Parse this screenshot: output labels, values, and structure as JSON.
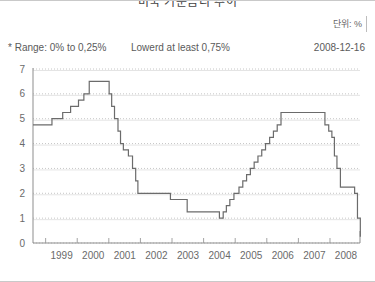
{
  "header": {
    "title": "미국 기준금리 추이",
    "unit_label": "단위: %"
  },
  "notes": {
    "range": "* Range: 0% to 0,25%",
    "lowered": "Lowerd at least 0,75%",
    "date": "2008-12-16"
  },
  "chart_data": {
    "type": "line",
    "title": "미국 기준금리 추이",
    "xlabel": "",
    "ylabel": "",
    "unit": "%",
    "grid": true,
    "legend_position": "none",
    "line_color": "#6b6b6b",
    "step": "post",
    "xlim": [
      1998.6,
      2008.95
    ],
    "ylim": [
      0,
      7
    ],
    "yticks": [
      0,
      1,
      2,
      3,
      4,
      5,
      6,
      7
    ],
    "ytick_labels": [
      "0",
      "1",
      "2",
      "3",
      "4",
      "5",
      "6",
      "7"
    ],
    "xticks": [
      1999,
      2000,
      2001,
      2002,
      2003,
      2004,
      2005,
      2006,
      2007,
      2008
    ],
    "xtick_labels": [
      "1999",
      "2000",
      "2001",
      "2002",
      "2003",
      "2004",
      "2005",
      "2006",
      "2007",
      "2008"
    ],
    "series": [
      {
        "name": "Federal Funds Rate",
        "x": [
          1998.6,
          1999.2,
          1999.54,
          1999.79,
          1999.88,
          2000.04,
          2000.21,
          2000.38,
          2001.01,
          2001.09,
          2001.18,
          2001.29,
          2001.37,
          2001.46,
          2001.62,
          2001.75,
          2001.85,
          2001.92,
          2002.95,
          2003.48,
          2004.5,
          2004.62,
          2004.72,
          2004.83,
          2004.96,
          2005.12,
          2005.24,
          2005.36,
          2005.48,
          2005.6,
          2005.72,
          2005.84,
          2005.96,
          2006.09,
          2006.21,
          2006.33,
          2006.45,
          2007.71,
          2007.84,
          2007.96,
          2008.06,
          2008.14,
          2008.22,
          2008.33,
          2008.78,
          2008.87,
          2008.96
        ],
        "y": [
          4.75,
          5.0,
          5.25,
          5.5,
          5.5,
          5.75,
          6.0,
          6.5,
          6.0,
          5.5,
          5.0,
          4.5,
          4.0,
          3.75,
          3.5,
          3.0,
          2.5,
          2.0,
          1.75,
          1.25,
          1.0,
          1.25,
          1.5,
          1.75,
          2.0,
          2.25,
          2.5,
          2.75,
          3.0,
          3.25,
          3.5,
          3.75,
          4.0,
          4.25,
          4.5,
          4.75,
          5.25,
          5.25,
          4.75,
          4.5,
          4.25,
          3.5,
          3.0,
          2.25,
          2.0,
          1.0,
          0.25
        ]
      }
    ],
    "annotations": [
      "* Range: 0% to 0,25%",
      "Lowerd at least 0,75%",
      "2008-12-16"
    ]
  }
}
